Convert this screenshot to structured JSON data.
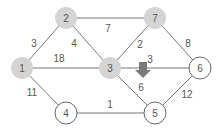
{
  "diagram": {
    "type": "weighted-undirected-graph",
    "colors": {
      "edge": "#777777",
      "visited_node_fill": "#d4d4d4",
      "unvisited_node_fill": "#ffffff",
      "node_stroke": "#666666",
      "arrow": "#7a7a7a",
      "text": "#555555"
    },
    "nodes": [
      {
        "id": "1",
        "label": "1",
        "x": 22,
        "y": 68,
        "visited": true
      },
      {
        "id": "2",
        "label": "2",
        "x": 66,
        "y": 18,
        "visited": true
      },
      {
        "id": "3",
        "label": "3",
        "x": 110,
        "y": 68,
        "visited": true
      },
      {
        "id": "4",
        "label": "4",
        "x": 66,
        "y": 113,
        "visited": false
      },
      {
        "id": "5",
        "label": "5",
        "x": 155,
        "y": 113,
        "visited": false
      },
      {
        "id": "6",
        "label": "6",
        "x": 200,
        "y": 68,
        "visited": false
      },
      {
        "id": "7",
        "label": "7",
        "x": 155,
        "y": 18,
        "visited": true
      }
    ],
    "edges": [
      {
        "from": "1",
        "to": "2",
        "weight": "3",
        "lx": 34,
        "ly": 47
      },
      {
        "from": "2",
        "to": "7",
        "weight": "7",
        "lx": 108,
        "ly": 32
      },
      {
        "from": "2",
        "to": "3",
        "weight": "4",
        "lx": 74,
        "ly": 47
      },
      {
        "from": "1",
        "to": "3",
        "weight": "18",
        "lx": 59,
        "ly": 62
      },
      {
        "from": "7",
        "to": "3",
        "weight": "2",
        "lx": 140,
        "ly": 48
      },
      {
        "from": "7",
        "to": "6",
        "weight": "8",
        "lx": 188,
        "ly": 47
      },
      {
        "from": "3",
        "to": "6",
        "weight": "3",
        "lx": 150,
        "ly": 63
      },
      {
        "from": "3",
        "to": "5",
        "weight": "6",
        "lx": 141,
        "ly": 91
      },
      {
        "from": "1",
        "to": "4",
        "weight": "11",
        "lx": 32,
        "ly": 96
      },
      {
        "from": "4",
        "to": "5",
        "weight": "1",
        "lx": 110,
        "ly": 108
      },
      {
        "from": "5",
        "to": "6",
        "weight": "12",
        "lx": 187,
        "ly": 98
      }
    ],
    "arrow": {
      "x": 143,
      "y": 62,
      "direction": "down"
    }
  }
}
